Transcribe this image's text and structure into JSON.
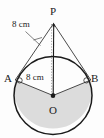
{
  "figure": {
    "type": "circle-with-external-point-tangents",
    "colors": {
      "stroke": "#1b1b1b",
      "shade_fill": "#dcdcdc",
      "background": "#fdfdfd",
      "thin_line": "#3a3a3a"
    },
    "points": [
      {
        "id": "P",
        "label": "P",
        "x": 53.5,
        "y": 22.0,
        "role": "external-point"
      },
      {
        "id": "A",
        "label": "A",
        "x": 14.5,
        "y": 80.0,
        "role": "tangent-point-left"
      },
      {
        "id": "B",
        "label": "B",
        "x": 90.5,
        "y": 80.0,
        "role": "tangent-point-right"
      },
      {
        "id": "O",
        "label": "O",
        "x": 53.0,
        "y": 101.5,
        "role": "centre"
      }
    ],
    "circle": {
      "cx": 53.0,
      "cy": 95.5,
      "r": 39.0
    },
    "dimensions": [
      {
        "id": "tangent-length",
        "label": "8 cm",
        "applies_to": "PA",
        "value": 8,
        "unit": "cm"
      },
      {
        "id": "radius-length",
        "label": "8 cm",
        "applies_to": "OA",
        "value": 8,
        "unit": "cm"
      }
    ],
    "segments": [
      {
        "id": "PA",
        "from": "P",
        "to": "A",
        "style": "solid-thin"
      },
      {
        "id": "PB",
        "from": "P",
        "to": "B",
        "style": "solid-thin"
      },
      {
        "id": "PO",
        "from": "P",
        "to": "O",
        "style": "solid"
      },
      {
        "id": "OA",
        "from": "O",
        "to": "A",
        "style": "solid-thin"
      },
      {
        "id": "OB",
        "from": "O",
        "to": "B",
        "style": "solid-thin"
      }
    ],
    "markers": [
      {
        "id": "angle-A",
        "at": "A",
        "kind": "right-angle-dot"
      },
      {
        "id": "angle-B",
        "at": "B",
        "kind": "right-angle-dot"
      },
      {
        "id": "centre-dot",
        "at": "O",
        "kind": "filled-dot"
      }
    ],
    "shaded_region": {
      "id": "major-sector-AOB",
      "description": "major sector bounded by radii OA and OB and the major arc",
      "fill": "#dcdcdc"
    }
  }
}
